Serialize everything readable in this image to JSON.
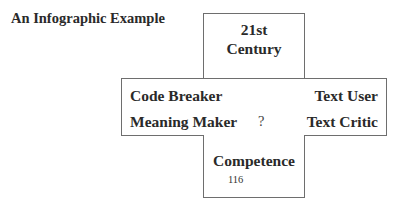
{
  "title": "An Infographic Example",
  "diagram": {
    "top_box": {
      "line1": "21st",
      "line2": "Century"
    },
    "middle_box": {
      "top_left": "Code Breaker",
      "top_right": "Text User",
      "bottom_left": "Meaning Maker",
      "center": "?",
      "bottom_right": "Text Critic"
    },
    "bottom_box": {
      "label": "Competence",
      "page_number": "116"
    }
  }
}
